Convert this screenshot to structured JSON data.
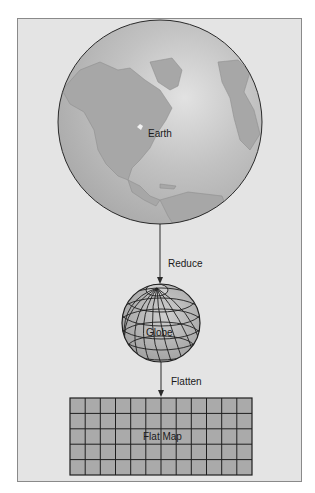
{
  "diagram": {
    "nodes": [
      {
        "id": "earth",
        "label": "Earth"
      },
      {
        "id": "globe",
        "label": "Globe"
      },
      {
        "id": "flat_map",
        "label": "Flat Map"
      }
    ],
    "edges": [
      {
        "from": "earth",
        "to": "globe",
        "label": "Reduce"
      },
      {
        "from": "globe",
        "to": "flat_map",
        "label": "Flatten"
      }
    ],
    "flat_map_grid": {
      "columns": 12,
      "rows": 5
    },
    "colors": {
      "frame_bg": "#e4e4e4",
      "earth_ocean": "#b9b9b9",
      "earth_land": "#a6a6a6",
      "globe_fill": "#b0b0b0",
      "map_fill": "#aaaaaa",
      "lines": "#2a2a2a"
    }
  }
}
